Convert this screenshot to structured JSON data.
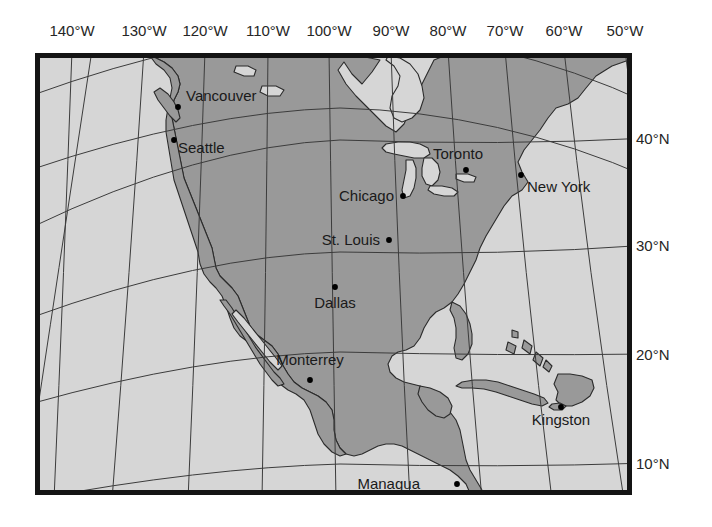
{
  "figure": {
    "kind": "reference-map",
    "title": "",
    "frame": {
      "x": 35,
      "y": 53,
      "width": 597,
      "height": 442,
      "border_color": "#141414",
      "border_width": 5
    },
    "colors": {
      "background": "#ffffff",
      "ocean": "#d6d6d6",
      "land": "#999999",
      "coastline": "#2b2b2b",
      "graticule": "#3c3c3c",
      "frame": "#141414",
      "label_text": "#1a1a1a",
      "city_dot": "#000000"
    }
  },
  "axes": {
    "longitude": {
      "unit": "°W",
      "ticks": [
        {
          "label": "140°W",
          "value": -140,
          "x": 72
        },
        {
          "label": "130°W",
          "value": -130,
          "x": 144
        },
        {
          "label": "120°W",
          "value": -120,
          "x": 205
        },
        {
          "label": "110°W",
          "value": -110,
          "x": 268
        },
        {
          "label": "100°W",
          "value": -100,
          "x": 329
        },
        {
          "label": "90°W",
          "value": -90,
          "x": 391
        },
        {
          "label": "80°W",
          "value": -80,
          "x": 448
        },
        {
          "label": "70°W",
          "value": -70,
          "x": 505
        },
        {
          "label": "60°W",
          "value": -60,
          "x": 564
        },
        {
          "label": "50°W",
          "value": -50,
          "x": 625
        }
      ]
    },
    "latitude": {
      "unit": "°N",
      "ticks": [
        {
          "label": "40°N",
          "value": 40,
          "y": 138
        },
        {
          "label": "30°N",
          "value": 30,
          "y": 245
        },
        {
          "label": "20°N",
          "value": 20,
          "y": 354
        },
        {
          "label": "10°N",
          "value": 10,
          "y": 463
        }
      ]
    }
  },
  "cities": [
    {
      "name": "Vancouver",
      "dot_x": 178,
      "dot_y": 107,
      "label_x": 186,
      "label_y": 101,
      "anchor": "start"
    },
    {
      "name": "Seattle",
      "dot_x": 174,
      "dot_y": 140,
      "label_x": 178,
      "label_y": 153,
      "anchor": "start"
    },
    {
      "name": "Toronto",
      "dot_x": 466,
      "dot_y": 170,
      "label_x": 458,
      "label_y": 159,
      "anchor": "middle"
    },
    {
      "name": "New York",
      "dot_x": 521,
      "dot_y": 175,
      "label_x": 527,
      "label_y": 192,
      "anchor": "start"
    },
    {
      "name": "Chicago",
      "dot_x": 403,
      "dot_y": 196,
      "label_x": 394,
      "label_y": 201,
      "anchor": "end"
    },
    {
      "name": "St. Louis",
      "dot_x": 389,
      "dot_y": 240,
      "label_x": 380,
      "label_y": 245,
      "anchor": "end"
    },
    {
      "name": "Dallas",
      "dot_x": 335,
      "dot_y": 287,
      "label_x": 335,
      "label_y": 308,
      "anchor": "middle"
    },
    {
      "name": "Monterrey",
      "dot_x": 310,
      "dot_y": 380,
      "label_x": 310,
      "label_y": 365,
      "anchor": "middle"
    },
    {
      "name": "Kingston",
      "dot_x": 561,
      "dot_y": 407,
      "label_x": 561,
      "label_y": 425,
      "anchor": "middle"
    },
    {
      "name": "Managua",
      "dot_x": 457,
      "dot_y": 484,
      "label_x": 420,
      "label_y": 489,
      "anchor": "end"
    }
  ],
  "graticule": {
    "meridians": [
      -150,
      -140,
      -130,
      -120,
      -110,
      -100,
      -90,
      -80,
      -70,
      -60,
      -50,
      -40
    ],
    "parallels": [
      10,
      20,
      30,
      40,
      50,
      60
    ],
    "line_width": 1
  },
  "regions": [
    {
      "name": "north-america-mainland",
      "type": "land"
    },
    {
      "name": "baja-california",
      "type": "land"
    },
    {
      "name": "vancouver-island",
      "type": "land"
    },
    {
      "name": "great-lakes",
      "type": "water"
    },
    {
      "name": "hudson-bay",
      "type": "water"
    },
    {
      "name": "cuba",
      "type": "land"
    },
    {
      "name": "hispaniola",
      "type": "land"
    },
    {
      "name": "jamaica",
      "type": "land"
    },
    {
      "name": "bahamas",
      "type": "land"
    },
    {
      "name": "yucatan",
      "type": "land"
    },
    {
      "name": "central-america",
      "type": "land"
    },
    {
      "name": "florida",
      "type": "land"
    }
  ]
}
